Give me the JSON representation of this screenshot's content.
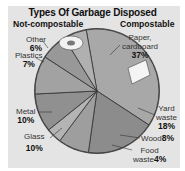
{
  "chart_data": {
    "type": "pie",
    "title": "Types Of Garbage Disposed",
    "groups": [
      {
        "name": "Not-compostable",
        "categories": [
          "Other",
          "Plastics",
          "Metal",
          "Glass"
        ]
      },
      {
        "name": "Compostable",
        "categories": [
          "Paper, cardboard",
          "Yard waste",
          "Wood",
          "Food waste"
        ]
      }
    ],
    "categories": [
      "Paper, cardboard",
      "Yard waste",
      "Wood",
      "Food waste",
      "Glass",
      "Metal",
      "Plastics",
      "Other"
    ],
    "values": [
      37,
      18,
      8,
      4,
      10,
      10,
      7,
      6
    ],
    "unit": "%",
    "labels": {
      "paper": {
        "name": "Paper,",
        "name2": "cardboard",
        "pct": "37%"
      },
      "yard": {
        "name": "Yard",
        "name2": "waste",
        "pct": "18%"
      },
      "wood": {
        "name": "Wood",
        "pct": "8%"
      },
      "food": {
        "name": "Food",
        "name2": "waste",
        "pct": "4%"
      },
      "glass": {
        "name": "Glass",
        "pct": "10%"
      },
      "metal": {
        "name": "Metal",
        "pct": "10%"
      },
      "plastics": {
        "name": "Plastics",
        "pct": "7%"
      },
      "other": {
        "name": "Other",
        "pct": "6%"
      }
    },
    "colors": {
      "background": "#e4e4e4",
      "slice_fill": "#9a9a9a",
      "slice_edge": "#333333"
    }
  },
  "header": {
    "title": "Types Of Garbage Disposed",
    "left_group": "Not-compostable",
    "right_group": "Compostable"
  }
}
